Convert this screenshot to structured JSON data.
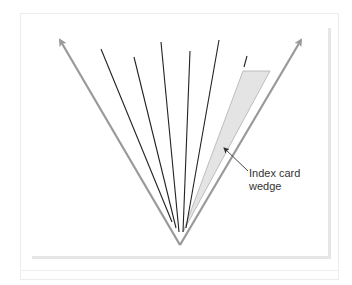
{
  "diagram": {
    "label_line1": "Index card",
    "label_line2": "wedge",
    "colors": {
      "arrow": "#999999",
      "line": "#222222",
      "wedge_fill": "#e4e4e4",
      "wedge_stroke": "#b0b0b0"
    },
    "vertex": [
      180,
      245
    ],
    "left_arrow_tip": [
      58,
      37
    ],
    "right_arrow_tip": [
      303,
      37
    ],
    "lines": [
      {
        "top": [
          101,
          49
        ],
        "bottom": [
          172,
          222
        ]
      },
      {
        "top": [
          134,
          57
        ],
        "bottom": [
          176,
          228
        ]
      },
      {
        "top": [
          161,
          42
        ],
        "bottom": [
          179,
          232
        ]
      },
      {
        "top": [
          190,
          51
        ],
        "bottom": [
          183,
          232
        ]
      },
      {
        "top": [
          219,
          40
        ],
        "bottom": [
          186,
          228
        ]
      },
      {
        "top": [
          247,
          56
        ],
        "bottom": [
          243,
          71
        ]
      }
    ],
    "wedge": [
      [
        243,
        71
      ],
      [
        270,
        71
      ],
      [
        183,
        232
      ]
    ]
  }
}
